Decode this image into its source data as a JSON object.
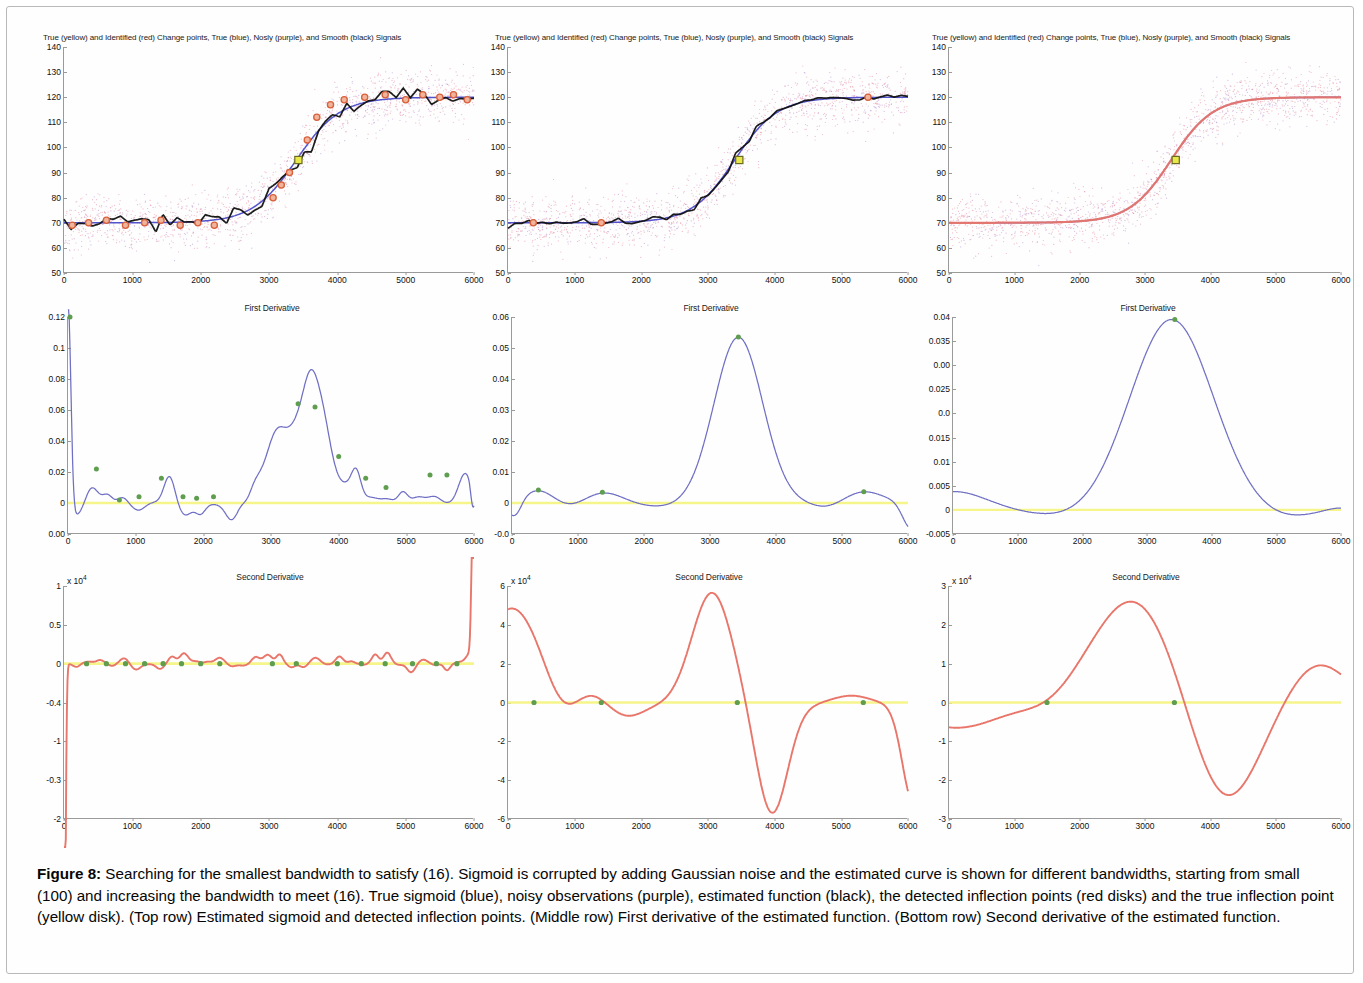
{
  "figure": {
    "caption_label": "Figure 8:",
    "caption_text": " Searching for the smallest bandwidth to satisfy (16). Sigmoid is corrupted by adding Gaussian noise and the estimated curve is shown for different bandwidths, starting from small (100) and increasing the bandwidth to meet (16). True sigmoid (blue), noisy observations (purple), estimated function (black), the detected inflection points (red disks) and the true inflection point (yellow disk). (Top row) Estimated sigmoid and detected inflection points. (Middle row) First derivative of the estimated function. (Bottom row) Second derivative of the estimated function."
  },
  "colors": {
    "true_signal": "#4a4ac8",
    "noisy": "#b38ad0",
    "noise_scatter": "#e8889f",
    "smooth": "#101010",
    "identified_changepoint": "#d8603c",
    "true_changepoint": "#e8e84a",
    "first_derivative": "#6f6fc4",
    "second_derivative": "#e8766a",
    "zero_line": "#f5f58a",
    "marker_green": "#5f9e4f",
    "axis": "#9a9a9a"
  },
  "chart_data": [
    {
      "id": "top-left",
      "type": "line",
      "title": "True (yellow) and Identified (red) Change points, True (blue), Nosly (purple), and Smooth (black) Signals",
      "xlabel": "",
      "ylabel": "",
      "xlim": [
        0,
        6000
      ],
      "ylim": [
        50,
        140
      ],
      "xticks": [
        0,
        1000,
        2000,
        3000,
        4000,
        5000,
        6000
      ],
      "yticks": [
        50,
        60,
        70,
        80,
        90,
        100,
        110,
        120,
        130,
        140
      ],
      "grid": false,
      "bandwidth": 100,
      "series": [
        {
          "name": "True sigmoid (blue)",
          "color": "#4a4ac8",
          "kind": "sigmoid",
          "low": 70,
          "high": 120,
          "center": 3400,
          "slope": 320
        },
        {
          "name": "Noisy observations (purple)",
          "color": "#b38ad0",
          "kind": "scatter",
          "noise_sd": 5
        },
        {
          "name": "Smooth signal (black)",
          "color": "#101010",
          "kind": "wiggly-sigmoid",
          "wiggle": 2.0
        }
      ],
      "identified_changepoints": [
        {
          "x": 120,
          "y": 69
        },
        {
          "x": 360,
          "y": 70
        },
        {
          "x": 620,
          "y": 71
        },
        {
          "x": 900,
          "y": 69
        },
        {
          "x": 1180,
          "y": 70
        },
        {
          "x": 1420,
          "y": 71
        },
        {
          "x": 1700,
          "y": 69
        },
        {
          "x": 1960,
          "y": 70
        },
        {
          "x": 2200,
          "y": 69
        },
        {
          "x": 3060,
          "y": 80
        },
        {
          "x": 3180,
          "y": 85
        },
        {
          "x": 3300,
          "y": 90
        },
        {
          "x": 3560,
          "y": 103
        },
        {
          "x": 3700,
          "y": 112
        },
        {
          "x": 3900,
          "y": 117
        },
        {
          "x": 4100,
          "y": 119
        },
        {
          "x": 4400,
          "y": 120
        },
        {
          "x": 4700,
          "y": 121
        },
        {
          "x": 5000,
          "y": 119
        },
        {
          "x": 5250,
          "y": 121
        },
        {
          "x": 5500,
          "y": 120
        },
        {
          "x": 5700,
          "y": 121
        },
        {
          "x": 5900,
          "y": 119
        }
      ],
      "true_changepoint": {
        "x": 3430,
        "y": 95
      }
    },
    {
      "id": "top-middle",
      "type": "line",
      "title": "True (yellow) and Identified (red) Change points, True (blue), Nosly (purple), and Smooth (black) Signals",
      "xlim": [
        0,
        6000
      ],
      "ylim": [
        50,
        140
      ],
      "xticks": [
        0,
        1000,
        2000,
        3000,
        4000,
        5000,
        6000
      ],
      "yticks": [
        50,
        60,
        70,
        80,
        90,
        100,
        110,
        120,
        130,
        140
      ],
      "grid": false,
      "bandwidth": 300,
      "series": [
        {
          "name": "True sigmoid (blue)",
          "color": "#4a4ac8",
          "kind": "sigmoid",
          "low": 70,
          "high": 120,
          "center": 3400,
          "slope": 320
        },
        {
          "name": "Noisy observations (purple)",
          "color": "#b38ad0",
          "kind": "scatter",
          "noise_sd": 5
        },
        {
          "name": "Smooth signal (black)",
          "color": "#101010",
          "kind": "wiggly-sigmoid",
          "wiggle": 0.7
        }
      ],
      "identified_changepoints": [
        {
          "x": 380,
          "y": 70
        },
        {
          "x": 1400,
          "y": 70
        },
        {
          "x": 5400,
          "y": 120
        }
      ],
      "true_changepoint": {
        "x": 3470,
        "y": 95
      }
    },
    {
      "id": "top-right",
      "type": "line",
      "title": "True (yellow) and Identified (red) Change points, True (blue), Nosly (purple), and Smooth (black) Signals",
      "xlim": [
        0,
        6000
      ],
      "ylim": [
        50,
        140
      ],
      "xticks": [
        0,
        1000,
        2000,
        3000,
        4000,
        5000,
        6000
      ],
      "yticks": [
        50,
        60,
        70,
        80,
        90,
        100,
        110,
        120,
        130,
        140
      ],
      "grid": false,
      "bandwidth": 800,
      "series": [
        {
          "name": "True sigmoid (blue)",
          "color": "#4a4ac8",
          "kind": "sigmoid",
          "low": 70,
          "high": 120,
          "center": 3400,
          "slope": 320
        },
        {
          "name": "Noisy observations (purple)",
          "color": "#b38ad0",
          "kind": "scatter",
          "noise_sd": 5
        },
        {
          "name": "Estimated function (red)",
          "color": "#e8766a",
          "kind": "smooth-sigmoid"
        }
      ],
      "identified_changepoints": [],
      "true_changepoint": {
        "x": 3470,
        "y": 95
      }
    },
    {
      "id": "middle-left",
      "type": "line",
      "title": "First Derivative",
      "xlim": [
        0,
        6000
      ],
      "ylim": [
        -0.02,
        0.12
      ],
      "xticks": [
        0,
        1000,
        2000,
        3000,
        4000,
        5000,
        6000
      ],
      "ytick_labels": [
        "0.12",
        "0.1",
        "0.08",
        "0.06",
        "0.04",
        "0.02",
        "0",
        "0.00"
      ],
      "yticks": [
        0.12,
        0.1,
        0.08,
        0.06,
        0.04,
        0.02,
        0,
        -0.02
      ],
      "grid": false,
      "zero_line": 0,
      "series": [
        {
          "name": "First derivative",
          "color": "#6f6fc4",
          "kind": "oscillatory-derivative"
        }
      ],
      "peaks": [
        {
          "x": 30,
          "y": 0.125
        },
        {
          "x": 420,
          "y": 0.022
        },
        {
          "x": 760,
          "y": 0.002
        },
        {
          "x": 1050,
          "y": 0.004
        },
        {
          "x": 1380,
          "y": 0.016
        },
        {
          "x": 1700,
          "y": 0.004
        },
        {
          "x": 1900,
          "y": 0.003
        },
        {
          "x": 2150,
          "y": 0.004
        },
        {
          "x": 3400,
          "y": 0.064
        },
        {
          "x": 3650,
          "y": 0.062
        },
        {
          "x": 4000,
          "y": 0.03
        },
        {
          "x": 4400,
          "y": 0.016
        },
        {
          "x": 4700,
          "y": 0.01
        },
        {
          "x": 5350,
          "y": 0.018
        },
        {
          "x": 5600,
          "y": 0.018
        }
      ]
    },
    {
      "id": "middle-middle",
      "type": "line",
      "title": "First Derivative",
      "xlim": [
        0,
        6000
      ],
      "ylim": [
        -0.01,
        0.06
      ],
      "xticks": [
        0,
        1000,
        2000,
        3000,
        4000,
        5000,
        6000
      ],
      "ytick_labels": [
        "0.06",
        "0.05",
        "0.04",
        "0.03",
        "0.02",
        "0.01",
        "0",
        "-0.0"
      ],
      "yticks": [
        0.06,
        0.05,
        0.04,
        0.03,
        0.02,
        0.01,
        0,
        -0.01
      ],
      "grid": false,
      "zero_line": 0,
      "series": [
        {
          "name": "First derivative",
          "color": "#6f6fc4",
          "kind": "single-peak-derivative"
        }
      ],
      "peaks": [
        {
          "x": 400,
          "y": 0.0042
        },
        {
          "x": 1370,
          "y": 0.0035
        },
        {
          "x": 3430,
          "y": 0.0535
        },
        {
          "x": 5330,
          "y": 0.0036
        }
      ]
    },
    {
      "id": "middle-right",
      "type": "line",
      "title": "First Derivative",
      "xlim": [
        0,
        6000
      ],
      "ylim": [
        -0.005,
        0.04
      ],
      "xticks": [
        0,
        1000,
        2000,
        3000,
        4000,
        5000,
        6000
      ],
      "ytick_labels": [
        "0.04",
        "0.035",
        "0.00",
        "0.025",
        "0.0",
        "0.015",
        "0.01",
        "0.005",
        "0",
        "-0.005"
      ],
      "yticks": [
        0.04,
        0.035,
        0.03,
        0.025,
        0.02,
        0.015,
        0.01,
        0.005,
        0,
        -0.005
      ],
      "grid": false,
      "zero_line": 0,
      "series": [
        {
          "name": "First derivative",
          "color": "#6f6fc4",
          "kind": "broad-peak-derivative"
        }
      ],
      "peaks": [
        {
          "x": 3430,
          "y": 0.0395
        }
      ]
    },
    {
      "id": "bottom-left",
      "type": "line",
      "title": "Second Derivative",
      "multiplier": "x 10",
      "multiplier_exp": "4",
      "xlim": [
        0,
        6000
      ],
      "ylim": [
        -2,
        1
      ],
      "xticks": [
        0,
        1000,
        2000,
        3000,
        4000,
        5000,
        6000
      ],
      "ytick_labels": [
        "1",
        "0.5",
        "0",
        "-0.4",
        "-1",
        "-0.3",
        "-2"
      ],
      "yticks": [
        1,
        0.5,
        0,
        -0.5,
        -1,
        -1.5,
        -2
      ],
      "grid": false,
      "zero_line": 0,
      "series": [
        {
          "name": "Second derivative",
          "color": "#e8766a",
          "kind": "oscillatory-second"
        }
      ],
      "zero_crossings": [
        {
          "x": 330
        },
        {
          "x": 620
        },
        {
          "x": 900
        },
        {
          "x": 1180
        },
        {
          "x": 1450
        },
        {
          "x": 1720
        },
        {
          "x": 2000
        },
        {
          "x": 2280
        },
        {
          "x": 3050
        },
        {
          "x": 3400
        },
        {
          "x": 4000
        },
        {
          "x": 4350
        },
        {
          "x": 4700
        },
        {
          "x": 5100
        },
        {
          "x": 5450
        },
        {
          "x": 5750
        }
      ]
    },
    {
      "id": "bottom-middle",
      "type": "line",
      "title": "Second Derivative",
      "multiplier": "x 10",
      "multiplier_exp": "4",
      "xlim": [
        0,
        6000
      ],
      "ylim": [
        -6,
        6
      ],
      "xticks": [
        0,
        1000,
        2000,
        3000,
        4000,
        5000,
        6000
      ],
      "ytick_labels": [
        "6",
        "4",
        "2",
        "0",
        "-2",
        "-4",
        "-6"
      ],
      "yticks": [
        6,
        4,
        2,
        0,
        -2,
        -4,
        -6
      ],
      "grid": false,
      "zero_line": 0,
      "series": [
        {
          "name": "Second derivative",
          "color": "#e8766a",
          "kind": "wave-second"
        }
      ],
      "zero_crossings": [
        {
          "x": 390
        },
        {
          "x": 1400
        },
        {
          "x": 3440
        },
        {
          "x": 5330
        }
      ]
    },
    {
      "id": "bottom-right",
      "type": "line",
      "title": "Second Derivative",
      "multiplier": "x 10",
      "multiplier_exp": "4",
      "xlim": [
        0,
        6000
      ],
      "ylim": [
        -3,
        3
      ],
      "xticks": [
        0,
        1000,
        2000,
        3000,
        4000,
        5000,
        6000
      ],
      "ytick_labels": [
        "3",
        "2",
        "1",
        "0",
        "-1",
        "-2",
        "-3"
      ],
      "yticks": [
        3,
        2,
        1,
        0,
        -1,
        -2,
        -3
      ],
      "grid": false,
      "zero_line": 0,
      "series": [
        {
          "name": "Second derivative",
          "color": "#e8766a",
          "kind": "broad-wave-second"
        }
      ],
      "zero_crossings": [
        {
          "x": 1500
        },
        {
          "x": 3450
        }
      ]
    }
  ]
}
